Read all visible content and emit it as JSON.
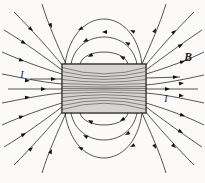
{
  "diagram": {
    "labels": {
      "magnetic_field": "B",
      "current_in": "I",
      "current_out": "I"
    },
    "colors": {
      "background": "#fbfaf8",
      "line": "#2b2b2b",
      "hatch": "#4a4a4a",
      "arrow": "#111111",
      "label": "#1a1a1a"
    }
  }
}
